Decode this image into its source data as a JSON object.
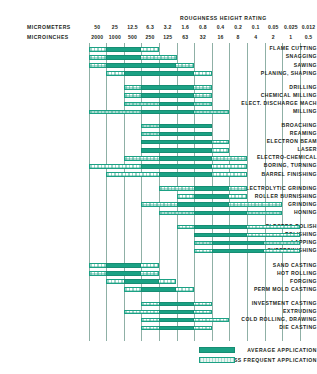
{
  "header": {
    "title": "ROUGHNESS HEIGHT RATING",
    "micrometers_label": "MICROMETERS",
    "microinches_label": "MICROINCHES"
  },
  "legend": {
    "average_label": "AVERAGE APPLICATION",
    "less_label": "LESS FREQUENT APPLICATION",
    "average_color": "#1ba184",
    "less_color": "#d9ece6"
  },
  "chart_data": {
    "type": "bar",
    "title": "ROUGHNESS HEIGHT RATING",
    "xlabel": "",
    "ylabel": "",
    "grid": true,
    "legend_position": "bottom-right",
    "micrometers": [
      "50",
      "25",
      "12.5",
      "6.3",
      "3.2",
      "1.6",
      "0.8",
      "0.4",
      "0.2",
      "0.1",
      "0.05",
      "0.025",
      "0.012"
    ],
    "microinches": [
      "2000",
      "1000",
      "500",
      "250",
      "125",
      "63",
      "32",
      "16",
      "8",
      "4",
      "2",
      "1",
      "0.5"
    ],
    "categories": [
      "FLAME CUTTING",
      "SNAGGING",
      "SAWING",
      "PLANING, SHAPING",
      "DRILLING",
      "CHEMICAL MILLING",
      "ELECT. DISCHARGE MACH",
      "MILLING",
      "BROACHING",
      "REAMING",
      "ELECTRON BEAM",
      "LASER",
      "ELECTRO-CHEMICAL",
      "BORING, TURNING",
      "BARREL FINISHING",
      "ELECTROLYTIC GRINDING",
      "ROLLER BURNISHING",
      "GRINDING",
      "HONING",
      "ELECTRO-POLISH",
      "POLISHING",
      "LAPPING",
      "SUPERFINISHING",
      "SAND CASTING",
      "HOT ROLLING",
      "FORGING",
      "PERM MOLD CASTING",
      "INVESTMENT CASTING",
      "EXTRUDING",
      "COLD ROLLING, DRAWING",
      "DIE CASTING"
    ],
    "groups": [
      {
        "name": "machining-rough",
        "rows": [
          0,
          1,
          2,
          3
        ]
      },
      {
        "name": "machining-mid",
        "rows": [
          4,
          5,
          6,
          7
        ]
      },
      {
        "name": "machining-fine",
        "rows": [
          8,
          9,
          10,
          11,
          12,
          13,
          14
        ]
      },
      {
        "name": "abrasive",
        "rows": [
          15,
          16,
          17,
          18
        ]
      },
      {
        "name": "finishing",
        "rows": [
          19,
          20,
          21,
          22
        ]
      },
      {
        "name": "casting-rough",
        "rows": [
          23,
          24,
          25,
          26
        ]
      },
      {
        "name": "casting-fine",
        "rows": [
          27,
          28,
          29,
          30
        ]
      }
    ],
    "rows": [
      {
        "label": "FLAME CUTTING",
        "avg": [
          1,
          2
        ],
        "less": [
          0,
          1,
          2,
          3
        ]
      },
      {
        "label": "SNAGGING",
        "avg": [
          1,
          2
        ],
        "less": [
          0,
          1,
          2,
          3,
          4
        ]
      },
      {
        "label": "SAWING",
        "avg": [
          1,
          2,
          3,
          4
        ],
        "less": [
          0,
          1,
          2,
          3,
          4,
          5
        ]
      },
      {
        "label": "PLANING, SHAPING",
        "avg": [
          2,
          3,
          4,
          5
        ],
        "less": [
          1,
          2,
          3,
          4,
          5,
          6
        ]
      },
      {
        "label": "DRILLING",
        "avg": [
          3,
          4,
          5
        ],
        "less": [
          2,
          3,
          4,
          5,
          6
        ]
      },
      {
        "label": "CHEMICAL MILLING",
        "avg": [
          3,
          4,
          5
        ],
        "less": [
          2,
          3,
          4,
          5,
          6
        ]
      },
      {
        "label": "ELECT. DISCHARGE MACH",
        "avg": [
          4,
          5
        ],
        "less": [
          2,
          3,
          4,
          5,
          6
        ]
      },
      {
        "label": "MILLING",
        "avg": [
          3,
          4,
          5
        ],
        "less": [
          0,
          1,
          2,
          3,
          4,
          5,
          6,
          7
        ]
      },
      {
        "label": "BROACHING",
        "avg": [
          4,
          5,
          6
        ],
        "less": [
          3,
          4,
          5,
          6
        ]
      },
      {
        "label": "REAMING",
        "avg": [
          4,
          5,
          6
        ],
        "less": [
          3,
          4,
          5,
          6
        ]
      },
      {
        "label": "ELECTRON BEAM",
        "avg": [
          3,
          4,
          5,
          6
        ],
        "less": [
          3,
          4,
          5,
          6,
          7
        ]
      },
      {
        "label": "LASER",
        "avg": [
          3,
          4,
          5,
          6
        ],
        "less": [
          3,
          4,
          5,
          6,
          7
        ]
      },
      {
        "label": "ELECTRO-CHEMICAL",
        "avg": [
          4,
          5,
          6
        ],
        "less": [
          2,
          3,
          4,
          5,
          6,
          7,
          8
        ]
      },
      {
        "label": "BORING, TURNING",
        "avg": [
          3,
          4,
          5,
          6
        ],
        "less": [
          0,
          1,
          2,
          3,
          4,
          5,
          6,
          7,
          8
        ]
      },
      {
        "label": "BARREL FINISHING",
        "avg": [
          4,
          5,
          6
        ],
        "less": [
          1,
          2,
          3,
          4,
          5,
          6,
          7,
          8
        ]
      },
      {
        "label": "ELECTROLYTIC GRINDING",
        "avg": [
          6,
          7
        ],
        "less": [
          4,
          5,
          6,
          7,
          8
        ]
      },
      {
        "label": "ROLLER BURNISHING",
        "avg": [
          6,
          7
        ],
        "less": [
          5,
          6,
          7,
          8
        ]
      },
      {
        "label": "GRINDING",
        "avg": [
          5,
          6,
          7
        ],
        "less": [
          3,
          4,
          5,
          6,
          7,
          8,
          9,
          10
        ]
      },
      {
        "label": "HONING",
        "avg": [
          6,
          7,
          8
        ],
        "less": [
          4,
          5,
          6,
          7,
          8,
          9,
          10
        ]
      },
      {
        "label": "ELECTRO-POLISH",
        "avg": [
          6,
          7,
          8
        ],
        "less": [
          5,
          6,
          7,
          8,
          9,
          10,
          11
        ]
      },
      {
        "label": "POLISHING",
        "avg": [
          6,
          7,
          8
        ],
        "less": [
          6,
          7,
          8,
          9,
          10,
          11
        ]
      },
      {
        "label": "LAPPING",
        "avg": [
          7,
          8,
          9
        ],
        "less": [
          6,
          7,
          8,
          9,
          10,
          11
        ]
      },
      {
        "label": "SUPERFINISHING",
        "avg": [
          7,
          8,
          9
        ],
        "less": [
          6,
          7,
          8,
          9,
          10,
          11
        ]
      },
      {
        "label": "SAND CASTING",
        "avg": [
          1,
          2
        ],
        "less": [
          0,
          1,
          2,
          3
        ]
      },
      {
        "label": "HOT ROLLING",
        "avg": [
          1,
          2
        ],
        "less": [
          0,
          1,
          2,
          3
        ]
      },
      {
        "label": "FORGING",
        "avg": [
          2,
          3
        ],
        "less": [
          1,
          2,
          3,
          4
        ]
      },
      {
        "label": "PERM MOLD CASTING",
        "avg": [
          3,
          4
        ],
        "less": [
          2,
          3,
          4,
          5
        ]
      },
      {
        "label": "INVESTMENT CASTING",
        "avg": [
          4,
          5
        ],
        "less": [
          3,
          4,
          5,
          6
        ]
      },
      {
        "label": "EXTRUDING",
        "avg": [
          4,
          5
        ],
        "less": [
          2,
          3,
          4,
          5,
          6
        ]
      },
      {
        "label": "COLD ROLLING, DRAWING",
        "avg": [
          4,
          5
        ],
        "less": [
          3,
          4,
          5,
          6,
          7
        ]
      },
      {
        "label": "DIE CASTING",
        "avg": [
          4,
          5
        ],
        "less": [
          3,
          4,
          5,
          6
        ]
      }
    ]
  }
}
